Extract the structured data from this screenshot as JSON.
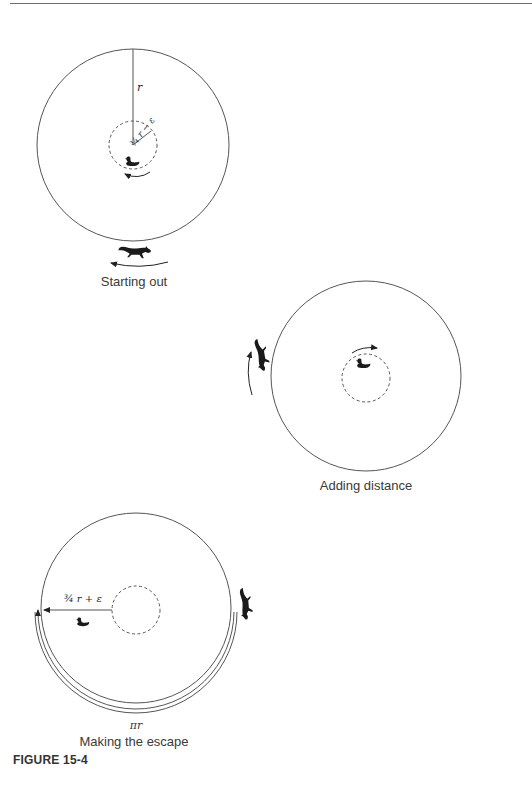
{
  "figure_label": "FIGURE 15-4",
  "panels": [
    {
      "caption": "Starting out",
      "radius_label": "r",
      "inner_radius_label": "¾ r − ε",
      "animals": [
        "duck-icon",
        "fox-icon"
      ],
      "duck_direction": "counterclockwise",
      "fox_direction": "counterclockwise"
    },
    {
      "caption": "Adding distance",
      "animals": [
        "duck-icon",
        "fox-icon"
      ],
      "duck_direction": "clockwise",
      "fox_direction": "counterclockwise"
    },
    {
      "caption": "Making the escape",
      "path_label": "¾ r + ε",
      "arc_label": "πr",
      "animals": [
        "duck-icon",
        "fox-icon"
      ]
    }
  ],
  "colors": {
    "line": "#555555",
    "ink": "#1a1a1a"
  }
}
